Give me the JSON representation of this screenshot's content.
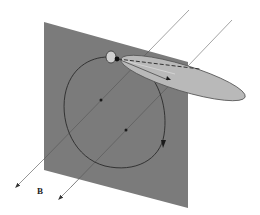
{
  "diagram": {
    "labels": {
      "field_label": "B"
    },
    "colors": {
      "plane": "#7b7b7b",
      "lobe_fill": "#b9b9b9",
      "lobe_edge": "#555555",
      "field_line": "#8a8a8a",
      "orbit": "#2a2a2a",
      "spot_fill": "#d0d0d0",
      "dot": "#111111",
      "background": "#ffffff"
    },
    "elements": [
      "field-line-1",
      "field-line-2",
      "plane",
      "orbit-loop",
      "orbit-direction-arrow",
      "spot",
      "source-dot",
      "emission-lobe",
      "dashed-axis",
      "field-label"
    ]
  }
}
